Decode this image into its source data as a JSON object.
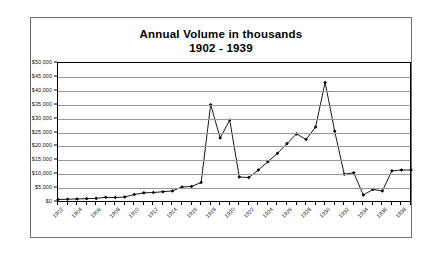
{
  "chart_data": {
    "type": "line",
    "title": "Annual Volume in thousands",
    "subtitle": "1902 - 1939",
    "xlabel": "",
    "ylabel": "",
    "ylim": [
      0,
      50000
    ],
    "ytick_step": 5000,
    "ytick_labels": [
      "$50,000",
      "$45,000",
      "$40,000",
      "$35,000",
      "$30,000",
      "$25,000",
      "$20,000",
      "$15,000",
      "$10,000",
      "$5,000",
      "$0"
    ],
    "ytick_values": [
      50000,
      45000,
      40000,
      35000,
      30000,
      25000,
      20000,
      15000,
      10000,
      5000,
      0
    ],
    "grid": true,
    "legend": false,
    "xtick_labels": [
      "1902",
      "1904",
      "1906",
      "1908",
      "1910",
      "1912",
      "1914",
      "1916",
      "1918",
      "1920",
      "1922",
      "1924",
      "1926",
      "1928",
      "1930",
      "1932",
      "1934",
      "1936",
      "1938"
    ],
    "xtick_interval": 2,
    "marker": "diamond",
    "line_color": "#000000",
    "x": [
      1902,
      1903,
      1904,
      1905,
      1906,
      1907,
      1908,
      1909,
      1910,
      1911,
      1912,
      1913,
      1914,
      1915,
      1916,
      1917,
      1918,
      1919,
      1920,
      1921,
      1922,
      1923,
      1924,
      1925,
      1926,
      1927,
      1928,
      1929,
      1930,
      1931,
      1932,
      1933,
      1934,
      1935,
      1936,
      1937,
      1938,
      1939
    ],
    "values": [
      900,
      1000,
      1100,
      1200,
      1300,
      1700,
      1600,
      1800,
      2700,
      3300,
      3400,
      3700,
      4000,
      5400,
      5600,
      7000,
      35000,
      23000,
      29500,
      9000,
      8800,
      11500,
      14500,
      17500,
      21000,
      24500,
      22500,
      27000,
      43000,
      25500,
      10000,
      10500,
      2500,
      4500,
      4000,
      11200,
      11500,
      11500
    ],
    "series": [
      {
        "name": "Annual Volume",
        "values": [
          900,
          1000,
          1100,
          1200,
          1300,
          1700,
          1600,
          1800,
          2700,
          3300,
          3400,
          3700,
          4000,
          5400,
          5600,
          7000,
          35000,
          23000,
          29500,
          9000,
          8800,
          11500,
          14500,
          17500,
          21000,
          24500,
          22500,
          27000,
          43000,
          25500,
          10000,
          10500,
          2500,
          4500,
          4000,
          11200,
          11500,
          11500
        ]
      }
    ]
  }
}
